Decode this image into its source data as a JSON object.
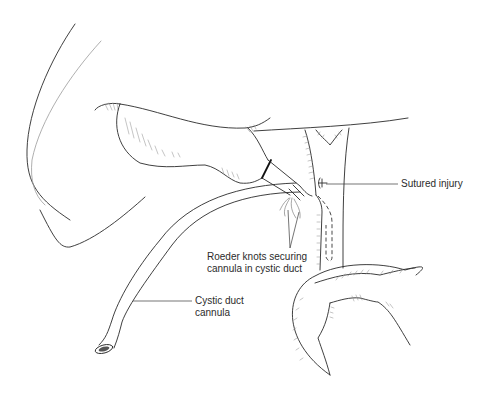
{
  "figure": {
    "type": "surgical line illustration",
    "background": "#ffffff",
    "stroke_color": "#2a2a2a"
  },
  "labels": {
    "sutured_injury": "Sutured injury",
    "roeder_knots_line1": "Roeder knots securing",
    "roeder_knots_line2": "cannula in cystic duct",
    "cannula_line1": "Cystic duct",
    "cannula_line2": "cannula"
  }
}
